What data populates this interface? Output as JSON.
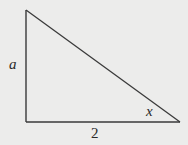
{
  "diagram": {
    "type": "right-triangle",
    "vertices": {
      "top": [
        26,
        10
      ],
      "right_angle": [
        26,
        122
      ],
      "right": [
        180,
        122
      ]
    },
    "labels": {
      "vertical_side": "a",
      "horizontal_side": "2",
      "angle": "x"
    },
    "colors": {
      "background": "#ececeb",
      "stroke": "#3a3a3a",
      "text": "#2a2a2a"
    }
  }
}
